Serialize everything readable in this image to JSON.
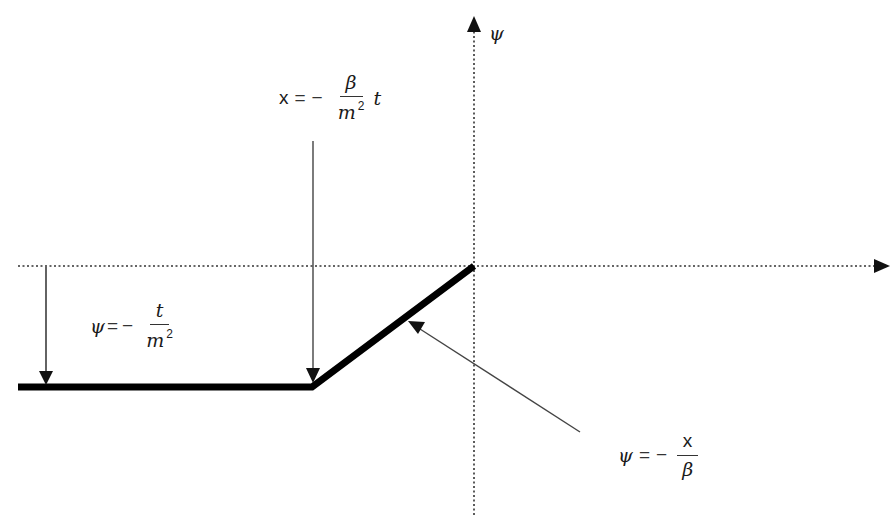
{
  "diagram": {
    "axes": {
      "y_axis_label": "ψ",
      "x_axis_label": "",
      "origin": {
        "x": 474,
        "y": 266
      },
      "style": "dotted"
    },
    "curve": {
      "description": "Thick piecewise-linear curve: constant at ψ = -t/m² for x ≤ -βt/m², then linear ψ = -x/β up to origin",
      "segments": [
        {
          "from": [
            18,
            387
          ],
          "to": [
            312,
            387
          ],
          "kind": "horizontal"
        },
        {
          "from": [
            312,
            387
          ],
          "to": [
            474,
            266
          ],
          "kind": "diagonal"
        }
      ]
    },
    "annotations": {
      "breakpoint": {
        "lhs": "x",
        "eq": "=",
        "minus": "−",
        "num": "β",
        "den_base": "m",
        "den_exp": "2",
        "suffix": "t"
      },
      "level": {
        "lhs": "ψ",
        "eq": "=",
        "minus": "−",
        "num": "t",
        "den_base": "m",
        "den_exp": "2"
      },
      "slope": {
        "lhs": "ψ",
        "eq": "=",
        "minus": "−",
        "num": "x",
        "den": "β"
      }
    },
    "colors": {
      "line": "#000000",
      "axis": "#333333",
      "arrow": "#333333",
      "background": "#ffffff"
    }
  }
}
